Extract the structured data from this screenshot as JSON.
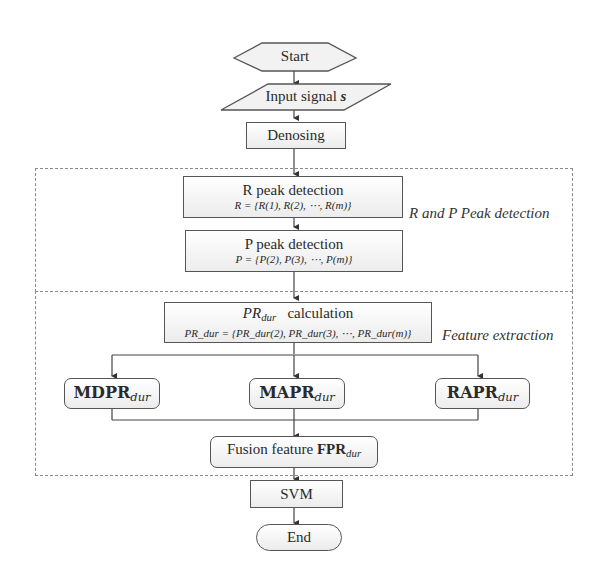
{
  "flowchart": {
    "start": {
      "label": "Start"
    },
    "input": {
      "label": "Input signal",
      "var": "s"
    },
    "denoising": {
      "label": "Denosing"
    },
    "r_peak": {
      "label": "R peak detection",
      "formula": "R = {R(1), R(2), ⋯, R(m)}"
    },
    "p_peak": {
      "label": "P peak detection",
      "formula": "P = {P(2), P(3), ⋯, P(m)}"
    },
    "pr_calc": {
      "var": "PR",
      "sub": "dur",
      "label": "calculation",
      "formula": "PR_dur = {PR_dur(2), PR_dur(3), ⋯, PR_dur(m)}"
    },
    "features": [
      {
        "main": "MDPR",
        "sub": "dur"
      },
      {
        "main": "MAPR",
        "sub": "dur"
      },
      {
        "main": "RAPR",
        "sub": "dur"
      }
    ],
    "fusion": {
      "label": "Fusion feature",
      "main": "FPR",
      "sub": "dur"
    },
    "svm": {
      "label": "SVM"
    },
    "end": {
      "label": "End"
    }
  },
  "regions": [
    {
      "label": "R and P Peak detection"
    },
    {
      "label": "Feature extraction"
    }
  ]
}
